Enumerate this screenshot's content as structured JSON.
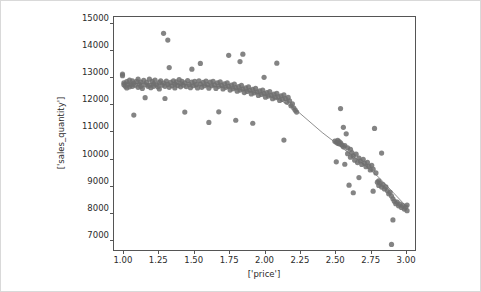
{
  "figure": {
    "background_color": "#ffffff",
    "border_color": "#d9d9d9",
    "axes_color": "#555555",
    "marker_color": "#6e6e6e",
    "line_color": "#8f8f8f"
  },
  "chart_data": {
    "type": "scatter",
    "title": "",
    "xlabel": "['price']",
    "ylabel": "['sales_quantity']",
    "xlim": [
      0.93,
      3.07
    ],
    "ylim": [
      6600,
      15250
    ],
    "grid": false,
    "legend": null,
    "xticks": [
      1.0,
      1.25,
      1.5,
      1.75,
      2.0,
      2.25,
      2.5,
      2.75,
      3.0
    ],
    "xticklabels": [
      "1.00",
      "1.25",
      "1.50",
      "1.75",
      "2.00",
      "2.25",
      "2.50",
      "2.75",
      "3.00"
    ],
    "yticks": [
      7000,
      8000,
      9000,
      10000,
      11000,
      12000,
      13000,
      14000,
      15000
    ],
    "yticklabels": [
      "7000",
      "8000",
      "9000",
      "10000",
      "11000",
      "12000",
      "13000",
      "14000",
      "15000"
    ],
    "series": [
      {
        "name": "observations",
        "type": "scatter",
        "marker": "o",
        "color": "#6e6e6e",
        "size": 5.2,
        "alpha": 0.85,
        "points": [
          [
            0.99,
            13150
          ],
          [
            0.99,
            13090
          ],
          [
            1.0,
            12830
          ],
          [
            1.0,
            12760
          ],
          [
            1.01,
            12700
          ],
          [
            1.02,
            12870
          ],
          [
            1.02,
            12640
          ],
          [
            1.03,
            12790
          ],
          [
            1.04,
            12930
          ],
          [
            1.04,
            12680
          ],
          [
            1.05,
            12760
          ],
          [
            1.06,
            12900
          ],
          [
            1.06,
            12700
          ],
          [
            1.07,
            12820
          ],
          [
            1.07,
            11640
          ],
          [
            1.08,
            12740
          ],
          [
            1.09,
            12880
          ],
          [
            1.1,
            12660
          ],
          [
            1.1,
            12960
          ],
          [
            1.11,
            12780
          ],
          [
            1.12,
            12700
          ],
          [
            1.12,
            12850
          ],
          [
            1.13,
            12620
          ],
          [
            1.14,
            12920
          ],
          [
            1.15,
            12760
          ],
          [
            1.15,
            12280
          ],
          [
            1.16,
            12840
          ],
          [
            1.17,
            12700
          ],
          [
            1.18,
            12960
          ],
          [
            1.18,
            12740
          ],
          [
            1.19,
            12650
          ],
          [
            1.2,
            12880
          ],
          [
            1.21,
            12790
          ],
          [
            1.21,
            12700
          ],
          [
            1.22,
            12930
          ],
          [
            1.23,
            12760
          ],
          [
            1.24,
            12680
          ],
          [
            1.25,
            12840
          ],
          [
            1.25,
            12600
          ],
          [
            1.26,
            12900
          ],
          [
            1.27,
            12740
          ],
          [
            1.28,
            14650
          ],
          [
            1.28,
            12820
          ],
          [
            1.29,
            12700
          ],
          [
            1.29,
            12250
          ],
          [
            1.3,
            12890
          ],
          [
            1.31,
            14400
          ],
          [
            1.31,
            12770
          ],
          [
            1.32,
            13390
          ],
          [
            1.32,
            12660
          ],
          [
            1.33,
            12840
          ],
          [
            1.34,
            12720
          ],
          [
            1.35,
            12900
          ],
          [
            1.36,
            12780
          ],
          [
            1.36,
            12640
          ],
          [
            1.37,
            12860
          ],
          [
            1.38,
            12730
          ],
          [
            1.39,
            12950
          ],
          [
            1.4,
            12800
          ],
          [
            1.4,
            12680
          ],
          [
            1.41,
            12880
          ],
          [
            1.42,
            12740
          ],
          [
            1.43,
            11750
          ],
          [
            1.43,
            12830
          ],
          [
            1.44,
            12690
          ],
          [
            1.45,
            12910
          ],
          [
            1.46,
            12770
          ],
          [
            1.47,
            12650
          ],
          [
            1.48,
            13330
          ],
          [
            1.48,
            12850
          ],
          [
            1.49,
            12720
          ],
          [
            1.5,
            12880
          ],
          [
            1.51,
            12760
          ],
          [
            1.52,
            12640
          ],
          [
            1.53,
            12900
          ],
          [
            1.54,
            13540
          ],
          [
            1.54,
            12780
          ],
          [
            1.55,
            12660
          ],
          [
            1.56,
            12840
          ],
          [
            1.57,
            12720
          ],
          [
            1.58,
            12890
          ],
          [
            1.59,
            12760
          ],
          [
            1.6,
            12630
          ],
          [
            1.6,
            11370
          ],
          [
            1.61,
            12850
          ],
          [
            1.62,
            12720
          ],
          [
            1.63,
            12880
          ],
          [
            1.64,
            12750
          ],
          [
            1.65,
            12620
          ],
          [
            1.66,
            12830
          ],
          [
            1.67,
            11760
          ],
          [
            1.67,
            12700
          ],
          [
            1.68,
            12860
          ],
          [
            1.69,
            12730
          ],
          [
            1.7,
            12600
          ],
          [
            1.71,
            12790
          ],
          [
            1.72,
            12660
          ],
          [
            1.73,
            12830
          ],
          [
            1.74,
            13840
          ],
          [
            1.74,
            12700
          ],
          [
            1.75,
            12560
          ],
          [
            1.76,
            12740
          ],
          [
            1.77,
            12610
          ],
          [
            1.78,
            12780
          ],
          [
            1.79,
            11450
          ],
          [
            1.79,
            12650
          ],
          [
            1.8,
            12520
          ],
          [
            1.81,
            12690
          ],
          [
            1.82,
            13610
          ],
          [
            1.82,
            12560
          ],
          [
            1.83,
            12730
          ],
          [
            1.84,
            13880
          ],
          [
            1.84,
            12600
          ],
          [
            1.85,
            12470
          ],
          [
            1.86,
            12640
          ],
          [
            1.87,
            12510
          ],
          [
            1.88,
            12680
          ],
          [
            1.89,
            12550
          ],
          [
            1.9,
            12420
          ],
          [
            1.91,
            11340
          ],
          [
            1.91,
            12590
          ],
          [
            1.92,
            12460
          ],
          [
            1.93,
            12620
          ],
          [
            1.94,
            12490
          ],
          [
            1.95,
            12360
          ],
          [
            1.96,
            12530
          ],
          [
            1.97,
            12400
          ],
          [
            1.98,
            12560
          ],
          [
            1.99,
            13030
          ],
          [
            1.99,
            12430
          ],
          [
            2.0,
            12300
          ],
          [
            2.01,
            12470
          ],
          [
            2.02,
            12340
          ],
          [
            2.03,
            12500
          ],
          [
            2.04,
            12370
          ],
          [
            2.05,
            12240
          ],
          [
            2.06,
            12410
          ],
          [
            2.07,
            12280
          ],
          [
            2.08,
            13550
          ],
          [
            2.08,
            12440
          ],
          [
            2.09,
            12310
          ],
          [
            2.1,
            12180
          ],
          [
            2.11,
            12350
          ],
          [
            2.12,
            12220
          ],
          [
            2.13,
            10720
          ],
          [
            2.13,
            12380
          ],
          [
            2.14,
            12250
          ],
          [
            2.15,
            12120
          ],
          [
            2.16,
            12290
          ],
          [
            2.17,
            12160
          ],
          [
            2.18,
            11980
          ],
          [
            2.19,
            12050
          ],
          [
            2.2,
            11900
          ],
          [
            2.21,
            11820
          ],
          [
            2.22,
            11750
          ],
          [
            2.49,
            10680
          ],
          [
            2.5,
            9920
          ],
          [
            2.5,
            10640
          ],
          [
            2.51,
            10710
          ],
          [
            2.51,
            10600
          ],
          [
            2.52,
            10660
          ],
          [
            2.52,
            10580
          ],
          [
            2.53,
            11880
          ],
          [
            2.53,
            10620
          ],
          [
            2.54,
            10540
          ],
          [
            2.55,
            11190
          ],
          [
            2.55,
            10470
          ],
          [
            2.56,
            9830
          ],
          [
            2.56,
            10520
          ],
          [
            2.57,
            10950
          ],
          [
            2.58,
            10430
          ],
          [
            2.58,
            10220
          ],
          [
            2.59,
            9060
          ],
          [
            2.6,
            10380
          ],
          [
            2.6,
            10090
          ],
          [
            2.61,
            10260
          ],
          [
            2.62,
            8780
          ],
          [
            2.62,
            10140
          ],
          [
            2.63,
            9980
          ],
          [
            2.64,
            10200
          ],
          [
            2.65,
            9890
          ],
          [
            2.66,
            10060
          ],
          [
            2.66,
            9340
          ],
          [
            2.67,
            9950
          ],
          [
            2.68,
            9820
          ],
          [
            2.69,
            10010
          ],
          [
            2.7,
            9870
          ],
          [
            2.71,
            9740
          ],
          [
            2.72,
            9900
          ],
          [
            2.73,
            9760
          ],
          [
            2.74,
            9620
          ],
          [
            2.75,
            9790
          ],
          [
            2.76,
            8840
          ],
          [
            2.76,
            9650
          ],
          [
            2.77,
            11150
          ],
          [
            2.78,
            9510
          ],
          [
            2.79,
            9170
          ],
          [
            2.8,
            9220
          ],
          [
            2.8,
            9050
          ],
          [
            2.81,
            9140
          ],
          [
            2.82,
            10240
          ],
          [
            2.82,
            8990
          ],
          [
            2.83,
            9080
          ],
          [
            2.84,
            8920
          ],
          [
            2.85,
            9000
          ],
          [
            2.86,
            8860
          ],
          [
            2.87,
            8740
          ],
          [
            2.88,
            8800
          ],
          [
            2.89,
            6880
          ],
          [
            2.89,
            8660
          ],
          [
            2.9,
            7780
          ],
          [
            2.9,
            8560
          ],
          [
            2.91,
            8470
          ],
          [
            2.92,
            8380
          ],
          [
            2.93,
            8440
          ],
          [
            2.94,
            8300
          ],
          [
            2.95,
            8360
          ],
          [
            2.96,
            8240
          ],
          [
            2.97,
            8310
          ],
          [
            2.98,
            8180
          ],
          [
            2.99,
            8250
          ],
          [
            3.0,
            8120
          ],
          [
            3.0,
            8330
          ]
        ]
      },
      {
        "name": "fitted-curve",
        "type": "line",
        "color": "#8f8f8f",
        "linewidth": 1,
        "points": [
          [
            0.99,
            12810
          ],
          [
            1.1,
            12800
          ],
          [
            1.2,
            12790
          ],
          [
            1.3,
            12780
          ],
          [
            1.4,
            12770
          ],
          [
            1.5,
            12750
          ],
          [
            1.6,
            12720
          ],
          [
            1.7,
            12680
          ],
          [
            1.8,
            12600
          ],
          [
            1.9,
            12500
          ],
          [
            2.0,
            12380
          ],
          [
            2.1,
            12200
          ],
          [
            2.2,
            11900
          ],
          [
            2.3,
            11450
          ],
          [
            2.4,
            11000
          ],
          [
            2.5,
            10600
          ],
          [
            2.6,
            10200
          ],
          [
            2.7,
            9800
          ],
          [
            2.8,
            9350
          ],
          [
            2.9,
            8800
          ],
          [
            3.0,
            8250
          ]
        ]
      }
    ]
  }
}
